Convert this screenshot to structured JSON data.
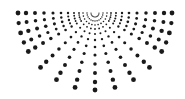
{
  "graphic": {
    "type": "halftone-dotted-semicircle-sunburst",
    "background": "#ffffff",
    "dot_color": "#1a1a1a",
    "center": [
      95,
      13
    ],
    "ray_angles_deg": [
      0,
      15,
      30,
      45,
      60,
      75,
      90,
      105,
      120,
      135,
      150,
      165,
      180
    ],
    "ray_radii": [
      4,
      8,
      12,
      16,
      21,
      27,
      34,
      42,
      51,
      60,
      69,
      77
    ],
    "dot_radius_min": 0.5,
    "dot_radius_max": 2.4,
    "vertical_scale": 1.0
  }
}
